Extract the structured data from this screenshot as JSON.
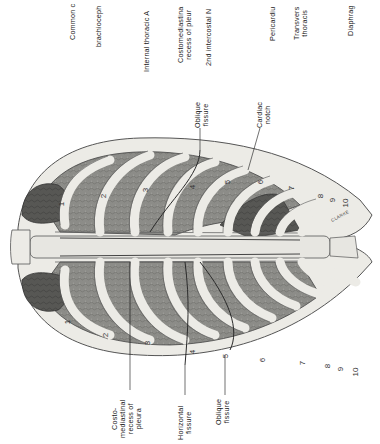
{
  "figure": {
    "orientation_deg": -90,
    "signature": "CLARKE",
    "colors": {
      "background": "#ffffff",
      "bone": "#ecebe6",
      "bone_outline": "#555555",
      "lung": "#8a8a86",
      "lung_dark": "#4a4a48",
      "pleura_line": "#3a3a3a",
      "text": "#222222"
    }
  },
  "labels_top": [
    {
      "id": "common-carotid",
      "text": "Common c"
    },
    {
      "id": "brachiocephalic",
      "text": "brachioceph"
    },
    {
      "id": "internal-thoracic",
      "text": "Internal thoracic A"
    },
    {
      "id": "costomediastinal-upper",
      "line1": "Costomediastina",
      "line2": "recess of pleur"
    },
    {
      "id": "intercostal-nerve",
      "text": "2nd intercostal N"
    },
    {
      "id": "pericardium",
      "text": "Pericardiu"
    },
    {
      "id": "transversus-thoracis",
      "line1": "Transvers",
      "line2": "thoracis"
    },
    {
      "id": "diaphragm",
      "text": "Diaphrag"
    }
  ],
  "labels_mid": [
    {
      "id": "oblique-fissure-left",
      "line1": "Oblique",
      "line2": "fissure"
    },
    {
      "id": "cardiac-notch",
      "line1": "Cardiac",
      "line2": "notch"
    }
  ],
  "labels_bottom": [
    {
      "id": "costomediastinal-lower",
      "line1": "Costo-",
      "line2": "mediastinal",
      "line3": "recess of",
      "line4": "pleura"
    },
    {
      "id": "horizontal-fissure",
      "line1": "Horizontal",
      "line2": "fissure"
    },
    {
      "id": "oblique-fissure-right",
      "line1": "Oblique",
      "line2": "fissure"
    }
  ],
  "rib_numbers_upper": [
    "1",
    "2",
    "3",
    "4",
    "5",
    "6",
    "7",
    "8",
    "9",
    "10"
  ],
  "rib_numbers_lower": [
    "1",
    "2",
    "3",
    "4",
    "5",
    "6",
    "7",
    "8",
    "9",
    "10"
  ]
}
